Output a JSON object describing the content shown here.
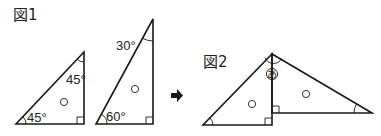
{
  "figure1": {
    "label": "図1",
    "triangle_45": {
      "angles": {
        "bottom_left": "45°",
        "top": "45°",
        "bottom_right": "right angle"
      },
      "center_mark": "○"
    },
    "triangle_30_60": {
      "angles": {
        "top": "30°",
        "bottom_left": "60°",
        "bottom_right": "right angle"
      },
      "center_mark": "○"
    }
  },
  "arrow": {
    "icon": "right-arrow-icon",
    "glyph": "➡"
  },
  "figure2": {
    "label": "図2",
    "unknown_angle_label": "あ",
    "left_triangle": {
      "center_mark": "○",
      "right_angle": true
    },
    "right_triangle": {
      "center_mark": "○",
      "right_angle": true
    }
  },
  "colors": {
    "stroke": "#1a1a1a",
    "background": "#ffffff"
  }
}
